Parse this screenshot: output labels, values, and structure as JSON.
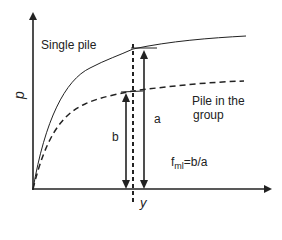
{
  "diagram": {
    "axes": {
      "y_label": "p",
      "x_label": "y"
    },
    "curves": [
      {
        "name": "Single pile",
        "style": "solid"
      },
      {
        "name": "Pile in the group",
        "style": "dashed"
      }
    ],
    "labels": {
      "single_pile": "Single pile",
      "pile_group_line1": "Pile in the",
      "pile_group_line2": "group",
      "b": "b",
      "a": "a",
      "formula_f": "f",
      "formula_sub": "ml",
      "formula_rest": "=b/a"
    },
    "colors": {
      "line": "#222222",
      "background": "#ffffff"
    }
  }
}
